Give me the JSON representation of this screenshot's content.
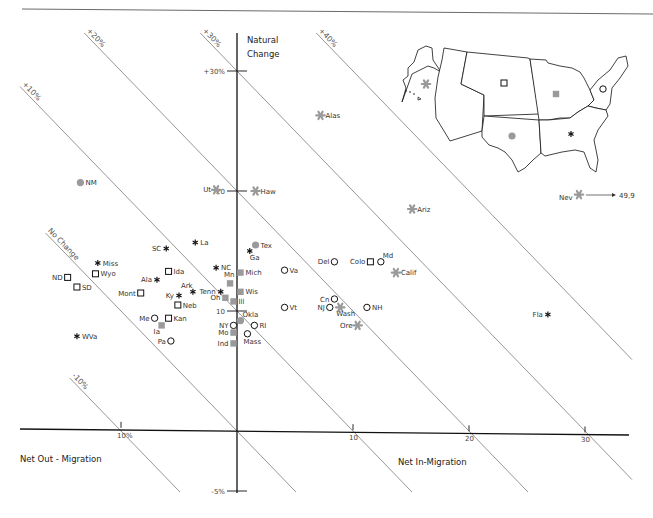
{
  "chart_data": {
    "type": "scatter",
    "title": "",
    "xlabel_left": "Net Out - Migration",
    "xlabel_right": "Net In-Migration",
    "ylabel": "Natural Change",
    "xlim": [
      -20,
      36
    ],
    "ylim": [
      -5,
      34
    ],
    "x_ticks": [
      {
        "value": -10,
        "label": "10%"
      },
      {
        "value": 10,
        "label": "10"
      },
      {
        "value": 20,
        "label": "20"
      },
      {
        "value": 30,
        "label": "30"
      }
    ],
    "y_ticks": [
      {
        "value": 30,
        "label": "+30%"
      },
      {
        "value": 20,
        "label": "20"
      },
      {
        "value": 10,
        "label": "10"
      },
      {
        "value": -5,
        "label": "-5%"
      }
    ],
    "isolines": [
      {
        "total": -10,
        "label": "-10%"
      },
      {
        "total": 0,
        "label": "No Change"
      },
      {
        "total": 10,
        "label": "+10%"
      },
      {
        "total": 20,
        "label": "+20%"
      },
      {
        "total": 30,
        "label": "+30%"
      },
      {
        "total": 40,
        "label": "+40%"
      }
    ],
    "legend": {
      "placement": "top-right",
      "kind": "regional map of the United States",
      "regions": [
        {
          "region": "Pacific / West (star)",
          "marker": "star"
        },
        {
          "region": "Plains / Mountain (open square)",
          "marker": "square-open"
        },
        {
          "region": "Midwest (gray square)",
          "marker": "square-gray"
        },
        {
          "region": "Northeast (open circle)",
          "marker": "circle-open"
        },
        {
          "region": "Southwest (gray circle)",
          "marker": "circle-gray"
        },
        {
          "region": "Southeast (asterisk)",
          "marker": "asterisk"
        }
      ]
    },
    "series": [
      {
        "name": "star",
        "points": [
          {
            "label": "Alas",
            "x": 7.2,
            "y": 26.3
          },
          {
            "label": "Ut",
            "x": -1.8,
            "y": 20.1
          },
          {
            "label": "Haw",
            "x": 1.6,
            "y": 20.0
          },
          {
            "label": "Ariz",
            "x": 15.1,
            "y": 18.5
          },
          {
            "label": "Calif",
            "x": 13.7,
            "y": 13.2
          },
          {
            "label": "Wash",
            "x": 8.9,
            "y": 10.3
          },
          {
            "label": "Ore",
            "x": 10.4,
            "y": 8.8
          },
          {
            "label": "Nev",
            "x": 49.9,
            "y": 19.7,
            "offscale": true,
            "annotation": "49,9"
          }
        ]
      },
      {
        "name": "asterisk",
        "points": [
          {
            "label": "La",
            "x": -3.6,
            "y": 15.7
          },
          {
            "label": "SC",
            "x": -6.1,
            "y": 15.2
          },
          {
            "label": "Ga",
            "x": 1.1,
            "y": 15.0
          },
          {
            "label": "Miss",
            "x": -12.0,
            "y": 14.0
          },
          {
            "label": "NC",
            "x": -1.8,
            "y": 13.6
          },
          {
            "label": "Ala",
            "x": -6.9,
            "y": 12.6
          },
          {
            "label": "Ark",
            "x": -3.8,
            "y": 11.6
          },
          {
            "label": "Ky",
            "x": -5.0,
            "y": 11.3
          },
          {
            "label": "Tenn",
            "x": -1.4,
            "y": 11.6
          },
          {
            "label": "WVa",
            "x": -13.8,
            "y": 7.9
          },
          {
            "label": "Fla",
            "x": 26.8,
            "y": 9.7
          }
        ]
      },
      {
        "name": "square-open",
        "points": [
          {
            "label": "Ida",
            "x": -5.9,
            "y": 13.3
          },
          {
            "label": "ND",
            "x": -14.6,
            "y": 12.8
          },
          {
            "label": "Wyo",
            "x": -12.2,
            "y": 13.1
          },
          {
            "label": "SD",
            "x": -13.8,
            "y": 12.0
          },
          {
            "label": "Mont",
            "x": -8.3,
            "y": 11.5
          },
          {
            "label": "Neb",
            "x": -5.1,
            "y": 10.5
          },
          {
            "label": "Kan",
            "x": -5.9,
            "y": 9.4
          },
          {
            "label": "Colo",
            "x": 11.5,
            "y": 14.1
          }
        ]
      },
      {
        "name": "square-gray",
        "points": [
          {
            "label": "Mich",
            "x": 0.3,
            "y": 13.2
          },
          {
            "label": "Mn",
            "x": -0.6,
            "y": 12.3
          },
          {
            "label": "Wis",
            "x": 0.3,
            "y": 11.6
          },
          {
            "label": "Oh",
            "x": -1.0,
            "y": 11.1
          },
          {
            "label": "Ill",
            "x": -0.3,
            "y": 10.8
          },
          {
            "label": "Ia",
            "x": -6.5,
            "y": 8.8
          },
          {
            "label": "Mo",
            "x": -0.3,
            "y": 8.2
          },
          {
            "label": "Ind",
            "x": -0.3,
            "y": 7.3
          }
        ]
      },
      {
        "name": "circle-open",
        "points": [
          {
            "label": "Va",
            "x": 4.1,
            "y": 13.4
          },
          {
            "label": "Del",
            "x": 8.4,
            "y": 14.1
          },
          {
            "label": "Md",
            "x": 12.4,
            "y": 14.1
          },
          {
            "label": "Vt",
            "x": 4.1,
            "y": 10.3
          },
          {
            "label": "Cn",
            "x": 8.4,
            "y": 11.0
          },
          {
            "label": "NJ",
            "x": 8.0,
            "y": 10.3
          },
          {
            "label": "NH",
            "x": 11.2,
            "y": 10.3
          },
          {
            "label": "Me",
            "x": -7.1,
            "y": 9.4
          },
          {
            "label": "NY",
            "x": -0.3,
            "y": 8.8
          },
          {
            "label": "RI",
            "x": 1.5,
            "y": 8.8
          },
          {
            "label": "Mass",
            "x": 0.9,
            "y": 8.1
          },
          {
            "label": "Pa",
            "x": -5.7,
            "y": 7.5
          }
        ]
      },
      {
        "name": "circle-gray",
        "points": [
          {
            "label": "NM",
            "x": -13.5,
            "y": 20.7
          },
          {
            "label": "Tex",
            "x": 1.6,
            "y": 15.5
          },
          {
            "label": "Okla",
            "x": 0.3,
            "y": 9.2
          }
        ]
      }
    ]
  },
  "colors": {
    "gray_marker": "#9a9a9a",
    "black_marker": "#111111",
    "isoline": "#8a8a8a",
    "axis": "#111111"
  }
}
